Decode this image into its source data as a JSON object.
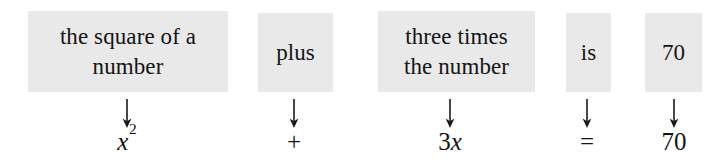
{
  "diagram": {
    "box_fill": "#e9e9e9",
    "text_color": "#141414",
    "background": "#ffffff",
    "columns": [
      {
        "id": "col-square-of-a-number",
        "phrase_lines": [
          "the square of a",
          "number"
        ],
        "phrase_plain": "the square of a number",
        "symbol_plain": "x^2",
        "symbol_base": "x",
        "symbol_exponent": "2",
        "arrow": "down-arrow"
      },
      {
        "id": "col-plus",
        "phrase_lines": [
          "plus"
        ],
        "phrase_plain": "plus",
        "symbol_plain": "+",
        "arrow": "down-arrow"
      },
      {
        "id": "col-three-times-the-number",
        "phrase_lines": [
          "three times",
          "the number"
        ],
        "phrase_plain": "three times the number",
        "symbol_plain": "3x",
        "symbol_coefficient": "3",
        "symbol_variable": "x",
        "arrow": "down-arrow"
      },
      {
        "id": "col-is",
        "phrase_lines": [
          "is"
        ],
        "phrase_plain": "is",
        "symbol_plain": "=",
        "arrow": "down-arrow"
      },
      {
        "id": "col-seventy",
        "phrase_lines": [
          "70"
        ],
        "phrase_plain": "70",
        "symbol_plain": "70",
        "arrow": "down-arrow"
      }
    ],
    "equation_plain": "x^2 + 3x = 70"
  }
}
